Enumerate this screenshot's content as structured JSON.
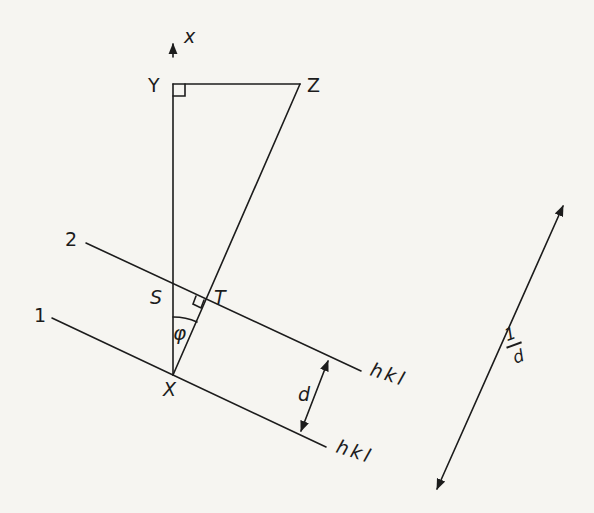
{
  "diagram": {
    "type": "crystal-plane-geometry",
    "colors": {
      "background": "#f6f5f1",
      "ink": "#1c1c1c"
    },
    "axis": {
      "label": "x",
      "direction": "up"
    },
    "points": {
      "Y": "Y",
      "Z": "Z",
      "S": "S",
      "T": "T",
      "X": "X"
    },
    "angle": {
      "label": "φ"
    },
    "planes": [
      {
        "id": "2",
        "number_label": "2",
        "index_label": "hkl"
      },
      {
        "id": "1",
        "number_label": "1",
        "index_label": "hkl"
      }
    ],
    "spacing": {
      "label": "d"
    },
    "reciprocal": {
      "numerator": "1",
      "denominator": "d"
    },
    "right_angle_markers": [
      "Y",
      "T"
    ]
  }
}
